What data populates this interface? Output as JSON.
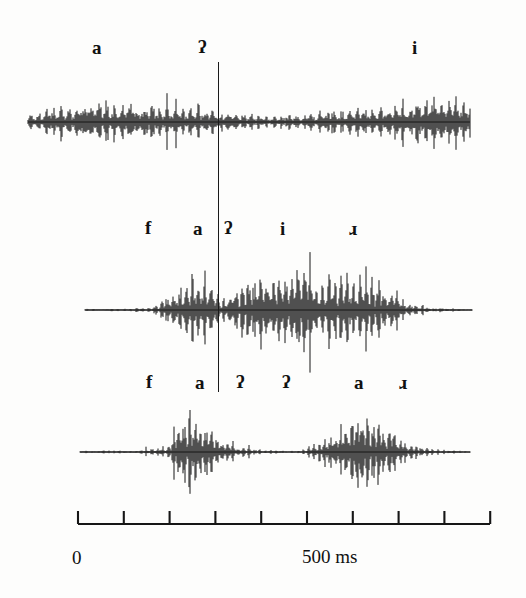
{
  "figure": {
    "background_color": "#fdfdfc",
    "ink_color": "#111111",
    "type": "speech-waveform-triplet"
  },
  "cursor": {
    "name": "alignment-cursor",
    "x_px": 218,
    "time_ms": 305
  },
  "panels": [
    {
      "id": "panel-top",
      "baseline_y": 122,
      "labels": [
        {
          "text": "a",
          "x": 92
        },
        {
          "text": "ʔ",
          "x": 198
        },
        {
          "text": "i",
          "x": 412
        }
      ]
    },
    {
      "id": "panel-middle",
      "baseline_y": 310,
      "labels": [
        {
          "text": "f",
          "x": 145
        },
        {
          "text": "a",
          "x": 193
        },
        {
          "text": "ʔ",
          "x": 231
        },
        {
          "text": "i",
          "x": 280
        },
        {
          "text": "ɹ",
          "x": 349
        }
      ]
    },
    {
      "id": "panel-bottom",
      "baseline_y": 452,
      "labels": [
        {
          "text": "f",
          "x": 146
        },
        {
          "text": "a",
          "x": 195
        },
        {
          "text": "ʔ",
          "x": 242
        },
        {
          "text": "ʔ",
          "x": 288
        },
        {
          "text": "a",
          "x": 354
        },
        {
          "text": "ɹ",
          "x": 399
        }
      ]
    }
  ],
  "axis": {
    "name": "time-axis",
    "start_x": 78,
    "end_x": 490,
    "tick_count": 10,
    "tick_spacing_px": 45.8,
    "labels": {
      "zero": "0",
      "five_hundred": "500 ms"
    },
    "unit": "ms",
    "range_ms": [
      0,
      900
    ]
  },
  "chart_data": {
    "type": "line",
    "title": "",
    "xlabel": "time (ms)",
    "ylabel": "amplitude",
    "xlim": [
      0,
      900
    ],
    "grid": false,
    "legend": "none",
    "annotations": [
      "a",
      "ʔ",
      "i",
      "f",
      "a",
      "ʔ",
      "i",
      "ɹ",
      "f",
      "a",
      "ʔ",
      "ʔ",
      "a",
      "ɹ"
    ],
    "series": [
      {
        "name": "panel-top-waveform",
        "description": "continuous noisy oscillation, high amplitude at start, dip at center, rising periodic voicing at end",
        "envelope_x": [
          28,
          60,
          100,
          140,
          175,
          200,
          218,
          240,
          270,
          300,
          330,
          360,
          390,
          420,
          450,
          470
        ],
        "envelope_y": [
          0.3,
          0.62,
          0.75,
          0.7,
          0.55,
          0.45,
          0.38,
          0.3,
          0.22,
          0.28,
          0.42,
          0.55,
          0.68,
          0.78,
          0.88,
          0.92
        ]
      },
      {
        "name": "panel-middle-waveform",
        "description": "silence then fricative, vowel burst, brief glottal dip at cursor, long voiced stretch, decay to silence",
        "envelope_x": [
          85,
          120,
          150,
          172,
          185,
          200,
          212,
          222,
          232,
          250,
          275,
          300,
          320,
          340,
          365,
          390,
          405,
          430,
          472
        ],
        "envelope_y": [
          0.02,
          0.03,
          0.05,
          0.35,
          0.72,
          0.85,
          0.6,
          0.2,
          0.45,
          0.7,
          0.82,
          0.95,
          0.72,
          0.88,
          0.78,
          0.55,
          0.2,
          0.05,
          0.02
        ]
      },
      {
        "name": "panel-bottom-waveform",
        "description": "silence, sharp vowel burst, long silent gap (double glottal stop), second vowel burst, decay",
        "envelope_x": [
          80,
          140,
          168,
          180,
          195,
          212,
          228,
          245,
          265,
          300,
          325,
          340,
          360,
          378,
          395,
          412,
          435,
          470
        ],
        "envelope_y": [
          0.02,
          0.04,
          0.15,
          0.85,
          0.95,
          0.55,
          0.22,
          0.1,
          0.04,
          0.03,
          0.3,
          0.7,
          0.92,
          0.75,
          0.45,
          0.18,
          0.06,
          0.02
        ]
      }
    ]
  }
}
